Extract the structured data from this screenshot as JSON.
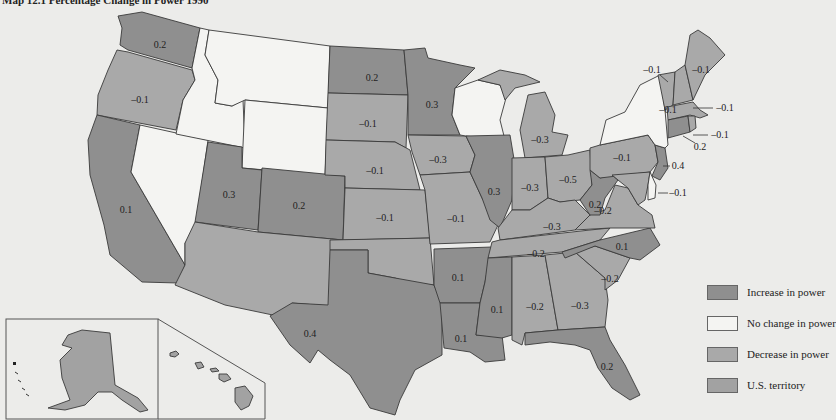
{
  "title": "Map 12.1 Percentage Change in Power 1990",
  "colors": {
    "increase": "#8f8f8f",
    "no_change": "#f4f4f2",
    "decrease": "#a9a9a9",
    "territory": "#a2a2a2",
    "background": "#ececea"
  },
  "legend": {
    "items": [
      {
        "key": "increase",
        "label": "Increase in power"
      },
      {
        "key": "no_change",
        "label": "No change in power"
      },
      {
        "key": "decrease",
        "label": "Decrease in power"
      },
      {
        "key": "territory",
        "label": "U.S. territory"
      }
    ]
  },
  "states": {
    "WA": {
      "value": "0.2",
      "status": "increase"
    },
    "OR": {
      "value": "–0.1",
      "status": "decrease"
    },
    "CA": {
      "value": "0.1",
      "status": "increase"
    },
    "ID": {
      "value": "",
      "status": "no_change"
    },
    "NV": {
      "value": "",
      "status": "no_change"
    },
    "MT": {
      "value": "",
      "status": "no_change"
    },
    "WY": {
      "value": "",
      "status": "no_change"
    },
    "UT": {
      "value": "0.3",
      "status": "increase"
    },
    "CO": {
      "value": "0.2",
      "status": "increase"
    },
    "AZ": {
      "value": "",
      "status": "decrease"
    },
    "NM": {
      "value": "",
      "status": "decrease"
    },
    "ND": {
      "value": "0.2",
      "status": "increase"
    },
    "SD": {
      "value": "–0.1",
      "status": "decrease"
    },
    "NE": {
      "value": "–0.1",
      "status": "decrease"
    },
    "KS": {
      "value": "–0.1",
      "status": "decrease"
    },
    "OK": {
      "value": "",
      "status": "decrease"
    },
    "TX": {
      "value": "0.4",
      "status": "increase"
    },
    "MN": {
      "value": "0.3",
      "status": "increase"
    },
    "IA": {
      "value": "–0.3",
      "status": "decrease"
    },
    "MO": {
      "value": "–0.1",
      "status": "decrease"
    },
    "AR": {
      "value": "0.1",
      "status": "increase"
    },
    "LA": {
      "value": "0.1",
      "status": "increase"
    },
    "WI": {
      "value": "",
      "status": "no_change"
    },
    "IL": {
      "value": "0.3",
      "status": "increase"
    },
    "MI": {
      "value": "–0.3",
      "status": "decrease"
    },
    "IN": {
      "value": "–0.3",
      "status": "decrease"
    },
    "OH": {
      "value": "–0.5",
      "status": "decrease"
    },
    "KY": {
      "value": "–0.3",
      "status": "decrease"
    },
    "TN": {
      "value": "–0.2",
      "status": "decrease"
    },
    "MS": {
      "value": "0.1",
      "status": "increase"
    },
    "AL": {
      "value": "–0.2",
      "status": "decrease"
    },
    "GA": {
      "value": "–0.3",
      "status": "decrease"
    },
    "FL": {
      "value": "0.2",
      "status": "increase"
    },
    "SC": {
      "value": "–0.2",
      "status": "decrease"
    },
    "NC": {
      "value": "0.1",
      "status": "increase"
    },
    "VA": {
      "value": "–0.2",
      "status": "decrease"
    },
    "WV": {
      "value": "0.2",
      "status": "increase"
    },
    "PA": {
      "value": "–0.1",
      "status": "decrease"
    },
    "NY": {
      "value": "",
      "status": "no_change"
    },
    "NJ": {
      "value": "0.4",
      "status": "increase"
    },
    "MD": {
      "value": "–0.1",
      "status": "decrease"
    },
    "DE": {
      "value": "",
      "status": "no_change"
    },
    "VT": {
      "value": "–0.1",
      "status": "decrease"
    },
    "NH": {
      "value": "–0.1",
      "status": "decrease"
    },
    "ME": {
      "value": "–0.1",
      "status": "decrease"
    },
    "MA": {
      "value": "–0.1",
      "status": "decrease"
    },
    "RI": {
      "value": "–0.1",
      "status": "decrease"
    },
    "CT": {
      "value": "0.2",
      "status": "increase"
    },
    "AK": {
      "value": "",
      "status": "territory"
    },
    "HI": {
      "value": "",
      "status": "territory"
    }
  }
}
